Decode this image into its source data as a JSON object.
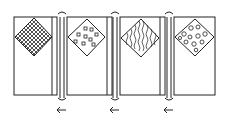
{
  "diagram": {
    "stroke_color": "#222222",
    "background": "#ffffff",
    "panels": [
      {
        "id": 1,
        "pattern": "crosshatch",
        "has_fold_strip": true
      },
      {
        "id": 2,
        "pattern": "small-squares",
        "has_fold_strip": true
      },
      {
        "id": 3,
        "pattern": "wavy-lines",
        "has_fold_strip": true
      },
      {
        "id": 4,
        "pattern": "swirls",
        "has_fold_strip": false
      }
    ],
    "connectors": [
      {
        "between": [
          1,
          2
        ],
        "arrow": "←"
      },
      {
        "between": [
          2,
          3
        ],
        "arrow": "←"
      },
      {
        "between": [
          3,
          4
        ],
        "arrow": "←"
      }
    ]
  }
}
